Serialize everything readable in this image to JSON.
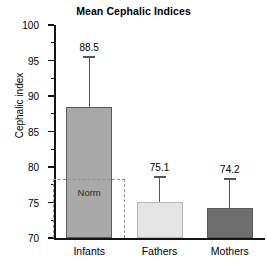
{
  "chart_data": {
    "type": "bar",
    "title": "Mean Cephalic Indices",
    "xlabel": "",
    "ylabel": "Cephalic index",
    "ylim": [
      70,
      100
    ],
    "ytick_step": 5,
    "yticks": [
      70,
      75,
      80,
      85,
      90,
      95,
      100
    ],
    "ytick_labels": [
      "70",
      "75",
      "80",
      "85",
      "90",
      "95",
      "100"
    ],
    "yminor_step": 2.5,
    "grid": false,
    "legend": "none",
    "categories": [
      "Infants",
      "Fathers",
      "Mothers"
    ],
    "values": [
      88.5,
      75.1,
      74.2
    ],
    "value_labels": [
      "88.5",
      "75.1",
      "74.2"
    ],
    "errors_upper": [
      95.6,
      78.7,
      78.4
    ],
    "bar_colors": [
      "#a9a9a9",
      "#e4e4e4",
      "#6e6e6e"
    ],
    "annotations": [
      {
        "name": "norm",
        "label": "Norm",
        "y_top": 78.3,
        "y_bottom": 70,
        "style": "dashed-rectangle",
        "color": "#8f8f8f"
      }
    ]
  },
  "bars": [
    {
      "category": "Infants",
      "value": 88.5,
      "value_label": "88.5",
      "error_upper": 95.6,
      "color": "#a9a9a9"
    },
    {
      "category": "Fathers",
      "value": 75.1,
      "value_label": "75.1",
      "error_upper": 78.7,
      "color": "#e4e4e4"
    },
    {
      "category": "Mothers",
      "value": 74.2,
      "value_label": "74.2",
      "error_upper": 78.4,
      "color": "#6e6e6e"
    }
  ],
  "axis": {
    "y_label": "Cephalic index",
    "y_ticks": [
      "100",
      "95",
      "90",
      "85",
      "80",
      "75",
      "70"
    ]
  },
  "norm": {
    "label": "Norm"
  }
}
